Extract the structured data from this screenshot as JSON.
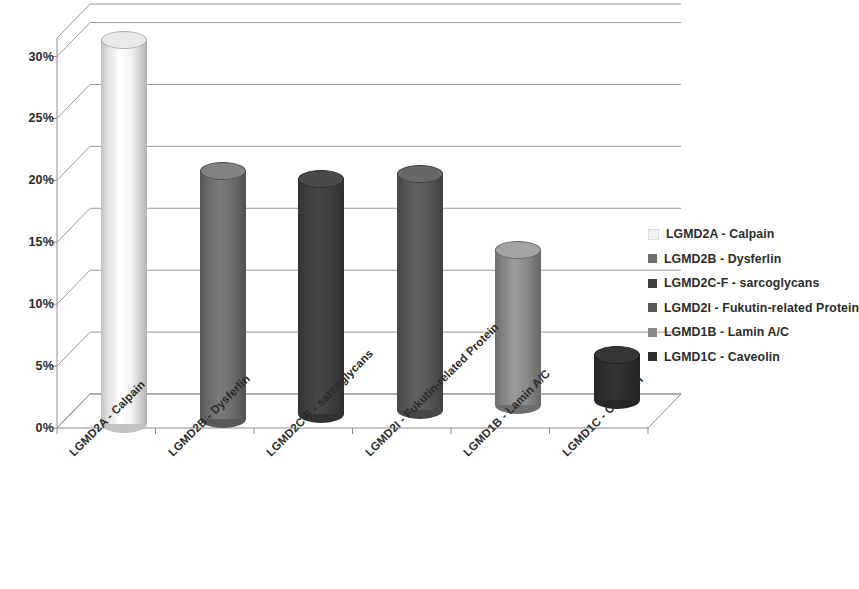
{
  "chart_data": {
    "type": "bar",
    "title": "",
    "subtitle": "",
    "xlabel": "",
    "ylabel": "",
    "categories": [
      "LGMD2A - Calpain",
      "LGMD2B - Dysferlin",
      "LGMD2C-F - sarcoglycans",
      "LGMD2I - Fukutin-related Protein",
      "LGMD1B - Lamin A/C",
      "LGMD1C - Caveolin"
    ],
    "values": [
      31,
      20,
      19,
      19,
      12.5,
      3.7
    ],
    "value_labels": [
      "31%",
      "20%",
      "19%",
      "19%",
      "12.5%",
      "3.7%"
    ],
    "ylim": [
      0,
      32
    ],
    "ytick_values": [
      0,
      5,
      10,
      15,
      20,
      25,
      30
    ],
    "ytick_labels": [
      "0%",
      "5%",
      "10%",
      "15%",
      "20%",
      "25%",
      "30%"
    ],
    "grid": true,
    "grid_axis": "y",
    "legend_position": "right",
    "style": "3d-cylinder",
    "series_colors": [
      "#f2f1ef",
      "#6e6e6e",
      "#3f3f3f",
      "#575757",
      "#8a8a8a",
      "#2e2e2e"
    ],
    "series": [
      {
        "name": "LGMD2A - Calpain",
        "value": 31,
        "color": "#f2f1ef"
      },
      {
        "name": "LGMD2B - Dysferlin",
        "value": 20,
        "color": "#6e6e6e"
      },
      {
        "name": "LGMD2C-F - sarcoglycans",
        "value": 19,
        "color": "#3f3f3f"
      },
      {
        "name": "LGMD2I - Fukutin-related Protein",
        "value": 19,
        "color": "#575757"
      },
      {
        "name": "LGMD1B - Lamin A/C",
        "value": 12.5,
        "color": "#8a8a8a"
      },
      {
        "name": "LGMD1C - Caveolin",
        "value": 3.7,
        "color": "#2e2e2e"
      }
    ]
  },
  "legend": {
    "items": [
      {
        "label": "LGMD2A - Calpain",
        "color": "#f2f1ef"
      },
      {
        "label": "LGMD2B - Dysferlin",
        "color": "#6e6e6e"
      },
      {
        "label": "LGMD2C-F - sarcoglycans",
        "color": "#3f3f3f"
      },
      {
        "label": "LGMD2I - Fukutin-related Protein",
        "color": "#575757"
      },
      {
        "label": "LGMD1B - Lamin A/C",
        "color": "#8a8a8a"
      },
      {
        "label": "LGMD1C - Caveolin",
        "color": "#2e2e2e"
      }
    ]
  },
  "axes": {
    "y_ticks": [
      "30%",
      "25%",
      "20%",
      "15%",
      "10%",
      "5%",
      "0%"
    ],
    "x_ticks": [
      "LGMD2A - Calpain",
      "LGMD2B - Dysferlin",
      "LGMD2C-F - sarcoglycans",
      "LGMD2I - Fukutin-related Protein",
      "LGMD1B - Lamin A/C",
      "LGMD1C - Caveolin"
    ]
  },
  "colors": {
    "background": "#ffffff",
    "gridline": "#9a9a9a",
    "axis": "#7d7d7d",
    "text": "#2b2b2b"
  }
}
